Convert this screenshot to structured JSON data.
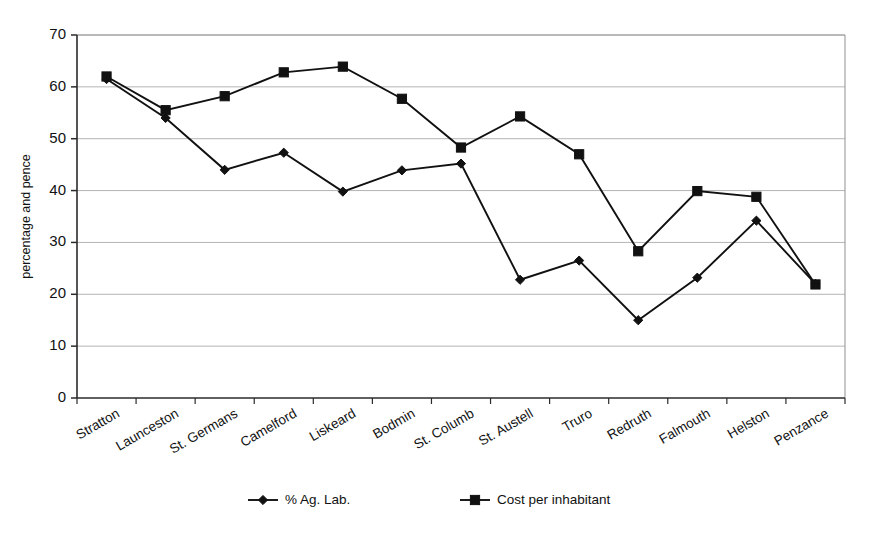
{
  "chart_data": {
    "type": "line",
    "title": "",
    "xlabel": "",
    "ylabel": "percentage and pence",
    "ylim": [
      0,
      70
    ],
    "ytick_step": 10,
    "yticks": [
      0,
      10,
      20,
      30,
      40,
      50,
      60,
      70
    ],
    "grid": "horizontal",
    "legend_position": "bottom",
    "categories": [
      "Stratton",
      "Launceston",
      "St. Germans",
      "Camelford",
      "Liskeard",
      "Bodmin",
      "St. Columb",
      "St. Austell",
      "Truro",
      "Redruth",
      "Falmouth",
      "Helston",
      "Penzance"
    ],
    "series": [
      {
        "name": "% Ag. Lab.",
        "marker": "diamond",
        "color": "#111111",
        "values": [
          61.5,
          54.0,
          44.0,
          47.3,
          39.8,
          43.9,
          45.2,
          22.8,
          26.5,
          15.0,
          23.2,
          34.2,
          22.0
        ]
      },
      {
        "name": "Cost per inhabitant",
        "marker": "square",
        "color": "#111111",
        "values": [
          62.0,
          55.5,
          58.2,
          62.8,
          63.9,
          57.7,
          48.3,
          54.3,
          47.0,
          28.3,
          39.9,
          38.8,
          21.9
        ]
      }
    ]
  },
  "legend": {
    "items": [
      {
        "label": "% Ag. Lab.",
        "marker": "diamond"
      },
      {
        "label": "Cost per inhabitant",
        "marker": "square"
      }
    ]
  },
  "axes": {
    "y_title": "percentage and pence"
  }
}
